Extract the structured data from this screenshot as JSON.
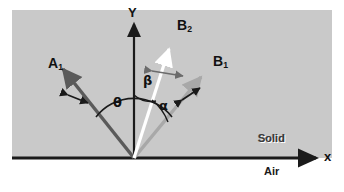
{
  "figure": {
    "background_color": "#ffffff",
    "solid_region_color": "#c9c9c9",
    "axes": {
      "y_label": "Y",
      "x_label": "x",
      "y_axis_color": "#1a1a1a",
      "x_axis_color": "#1a1a1a"
    },
    "media": {
      "upper_label": "Solid",
      "lower_label": "Air"
    },
    "rays": [
      {
        "id": "A1",
        "label": "A",
        "subscript": "1",
        "color": "#5a5a5a",
        "role": "incident-ray",
        "polarization_marker": "double-arrow"
      },
      {
        "id": "B2",
        "label": "B",
        "subscript": "2",
        "color": "#ffffff",
        "role": "scattered-ray",
        "polarization_marker": "double-arrow"
      },
      {
        "id": "B1",
        "label": "B",
        "subscript": "1",
        "color": "#a8a8a8",
        "role": "scattered-ray",
        "polarization_marker": "double-arrow"
      }
    ],
    "angles": [
      {
        "id": "theta",
        "symbol": "θ",
        "between": "A1 and B1"
      },
      {
        "id": "beta",
        "symbol": "β",
        "between": "Y axis and B2"
      },
      {
        "id": "alpha",
        "symbol": "α",
        "between": "B2 and B1"
      }
    ]
  }
}
